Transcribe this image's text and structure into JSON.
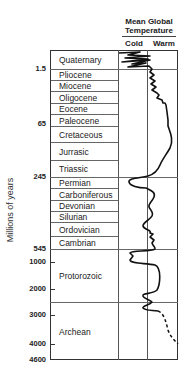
{
  "header": {
    "title_line1": "Mean Global",
    "title_line2": "Temperature",
    "cold": "Cold",
    "warm": "Warm"
  },
  "axis": {
    "ylabel": "Millions of years",
    "ticks": [
      "1.5",
      "65",
      "245",
      "545",
      "1000",
      "2000",
      "3000",
      "4000",
      "4600"
    ]
  },
  "periods": [
    {
      "name": "Quaternary",
      "top": 50,
      "bottom": 69
    },
    {
      "name": "Pliocene",
      "top": 69,
      "bottom": 80
    },
    {
      "name": "Miocene",
      "top": 80,
      "bottom": 91
    },
    {
      "name": "Oligocene",
      "top": 91,
      "bottom": 103
    },
    {
      "name": "Eocene",
      "top": 103,
      "bottom": 114
    },
    {
      "name": "Paleocene",
      "top": 114,
      "bottom": 126
    },
    {
      "name": "Cretaceous",
      "top": 126,
      "bottom": 142
    },
    {
      "name": "Jurrasic",
      "top": 142,
      "bottom": 160
    },
    {
      "name": "Triassic",
      "top": 160,
      "bottom": 177
    },
    {
      "name": "Permian",
      "top": 177,
      "bottom": 188
    },
    {
      "name": "Carboniferous",
      "top": 188,
      "bottom": 200
    },
    {
      "name": "Devonian",
      "top": 200,
      "bottom": 211
    },
    {
      "name": "Silurian",
      "top": 211,
      "bottom": 222
    },
    {
      "name": "Ordovician",
      "top": 222,
      "bottom": 236
    },
    {
      "name": "Cambrian",
      "top": 236,
      "bottom": 249
    },
    {
      "name": "Protorozoic",
      "top": 249,
      "bottom": 302
    },
    {
      "name": "Archean",
      "top": 302,
      "bottom": 360
    }
  ],
  "chart_data": {
    "type": "line",
    "title": "Mean Global Temperature",
    "xlabel": "Cold — Warm",
    "ylabel": "Millions of years",
    "y_ticks": [
      1.5,
      65,
      245,
      545,
      1000,
      2000,
      3000,
      4000,
      4600
    ],
    "x_categories": [
      "Cold",
      "Warm"
    ],
    "categories": [
      "Quaternary",
      "Pliocene",
      "Miocene",
      "Oligocene",
      "Eocene",
      "Paleocene",
      "Cretaceous",
      "Jurrasic",
      "Triassic",
      "Permian",
      "Carboniferous",
      "Devonian",
      "Silurian",
      "Ordovician",
      "Cambrian",
      "Protorozoic",
      "Archean"
    ],
    "series": [
      {
        "name": "Relative temperature (0=cold, 1=warm)",
        "values": [
          0.3,
          0.55,
          0.6,
          0.7,
          0.85,
          0.9,
          0.95,
          0.85,
          0.7,
          0.2,
          0.6,
          0.55,
          0.6,
          0.5,
          0.65,
          0.5,
          0.7
        ]
      }
    ],
    "grid": false
  }
}
